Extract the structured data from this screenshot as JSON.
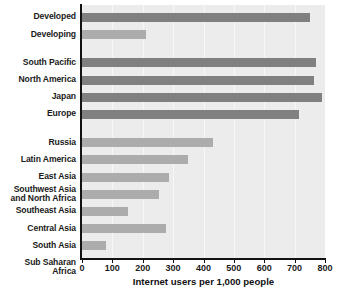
{
  "chart_data": {
    "type": "bar",
    "orientation": "horizontal",
    "title": "",
    "xlabel": "Internet users per 1,000 people",
    "ylabel": "",
    "xlim": [
      0,
      800
    ],
    "xticks": [
      0,
      100,
      200,
      300,
      400,
      500,
      600,
      700,
      800
    ],
    "grid": true,
    "legend": "none",
    "groups": [
      {
        "name": "development-status",
        "categories": [
          "Developed",
          "Developing"
        ],
        "values": [
          750,
          210
        ],
        "shades": [
          "dark",
          "light"
        ]
      },
      {
        "name": "developed-regions",
        "categories": [
          "South Pacific",
          "North America",
          "Japan",
          "Europe"
        ],
        "values": [
          770,
          765,
          790,
          715
        ],
        "shades": [
          "dark",
          "dark",
          "dark",
          "dark"
        ]
      },
      {
        "name": "developing-regions",
        "categories": [
          "Russia",
          "Latin America",
          "East Asia",
          "Southwest Asia\nand North Africa",
          "Southeast Asia",
          "Central Asia",
          "South Asia",
          "Sub Saharan Africa"
        ],
        "values": [
          430,
          350,
          285,
          255,
          150,
          275,
          80,
          115
        ],
        "shades": [
          "light",
          "light",
          "light",
          "light",
          "light",
          "light",
          "light",
          "light"
        ]
      }
    ],
    "categories": [
      "Developed",
      "Developing",
      "South Pacific",
      "North America",
      "Japan",
      "Europe",
      "Russia",
      "Latin America",
      "East Asia",
      "Southwest Asia\nand North Africa",
      "Southeast Asia",
      "Central Asia",
      "South Asia",
      "Sub Saharan Africa"
    ],
    "values": [
      750,
      210,
      770,
      765,
      790,
      715,
      430,
      350,
      285,
      255,
      150,
      275,
      80,
      115
    ],
    "colors": {
      "bar_dark": "#808080",
      "bar_light": "#acacac",
      "plot_background": "#ececec",
      "gridline": "#f7f7f7",
      "axis": "#121212",
      "text": "#1a1a1a"
    }
  }
}
